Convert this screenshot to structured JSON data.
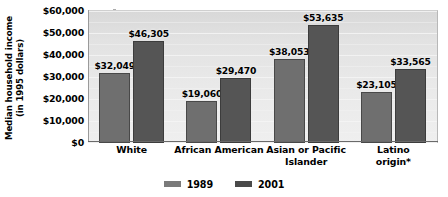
{
  "chart_data": {
    "type": "bar",
    "title": "",
    "subtitle": "",
    "xlabel": "",
    "ylabel": "Median household income\n(in 1995 dollars)",
    "ylabel_line1": "Median household income",
    "ylabel_line2": "(in 1995 dollars)",
    "categories": [
      "White",
      "African American",
      "Asian or Pacific Islander",
      "Latino origin*"
    ],
    "category_lines": [
      [
        "White"
      ],
      [
        "African American"
      ],
      [
        "Asian or Pacific",
        "Islander"
      ],
      [
        "Latino origin*"
      ]
    ],
    "series": [
      {
        "name": "1989",
        "color": "#6f6f6f",
        "values": [
          32049,
          19060,
          38053,
          23105
        ],
        "labels": [
          "$32,049",
          "$19,060",
          "$38,053",
          "$23,105"
        ]
      },
      {
        "name": "2001",
        "color": "#555555",
        "values": [
          46305,
          29470,
          53635,
          33565
        ],
        "labels": [
          "$46,305",
          "$29,470",
          "$53,635",
          "$33,565"
        ]
      }
    ],
    "ylim": [
      0,
      60000
    ],
    "ytick_values": [
      0,
      10000,
      20000,
      30000,
      40000,
      50000,
      60000
    ],
    "ytick_labels": [
      "$0",
      "$10,000",
      "$20,000",
      "$30,000",
      "$40,000",
      "$50,000",
      "$60,000"
    ],
    "grid": true,
    "grid_axis": "y",
    "legend_position": "bottom-center",
    "legend_entries": [
      "1989",
      "2001"
    ],
    "footnote": "*",
    "plot_background": "#e6e6e6",
    "figure_background": "#ffffff"
  }
}
